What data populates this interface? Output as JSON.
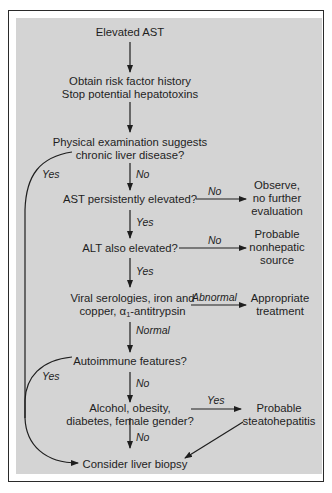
{
  "diagram": {
    "type": "flowchart",
    "nodes": {
      "start": "Elevated AST",
      "history_1": "Obtain risk factor history",
      "history_2": "Stop potential hepatotoxins",
      "exam_1": "Physical examination suggests",
      "exam_2": "chronic liver disease?",
      "ast_persist": "AST persistently elevated?",
      "observe_1": "Observe,",
      "observe_2": "no further",
      "observe_3": "evaluation",
      "alt": "ALT also elevated?",
      "nonhep_1": "Probable",
      "nonhep_2": "nonhepatic",
      "nonhep_3": "source",
      "viral_1": "Viral serologies, iron and",
      "viral_2a": "copper, α",
      "viral_2sub": "1",
      "viral_2b": "-antitrypsin",
      "treat_1": "Appropriate",
      "treat_2": "treatment",
      "autoimmune": "Autoimmune features?",
      "alcohol_1": "Alcohol, obesity,",
      "alcohol_2": "diabetes, female gender?",
      "steato_1": "Probable",
      "steato_2": "steatohepatitis",
      "biopsy": "Consider liver biopsy"
    },
    "edge_labels": {
      "exam_yes": "Yes",
      "exam_no": "No",
      "ast_no": "No",
      "ast_yes": "Yes",
      "alt_no": "No",
      "alt_yes": "Yes",
      "viral_abnormal": "Abnormal",
      "viral_normal": "Normal",
      "auto_yes": "Yes",
      "auto_no": "No",
      "alcohol_yes": "Yes",
      "alcohol_no": "No"
    },
    "colors": {
      "panel": "#d4d4d4",
      "ink": "#1e1e1e",
      "border": "#2a2a2a"
    }
  }
}
